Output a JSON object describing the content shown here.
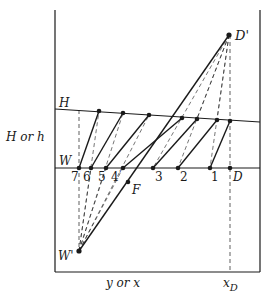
{
  "diagram": {
    "type": "McCabe-Thiele style graphical construction (H-W diagram)",
    "labels": {
      "top_line": "H",
      "bottom_line": "W",
      "y_axis": "H or h",
      "x_axis": "y or x",
      "x_tick": "x",
      "x_tick_sub": "D",
      "upper_pole": "D'",
      "lower_pole": "W'",
      "feed": "F",
      "end_point": "D"
    },
    "stage_numbers": [
      "7",
      "6",
      "5",
      "4",
      "3",
      "2",
      "1"
    ],
    "colors": {
      "ink": "#1a1a1a",
      "background": "#ffffff"
    }
  }
}
